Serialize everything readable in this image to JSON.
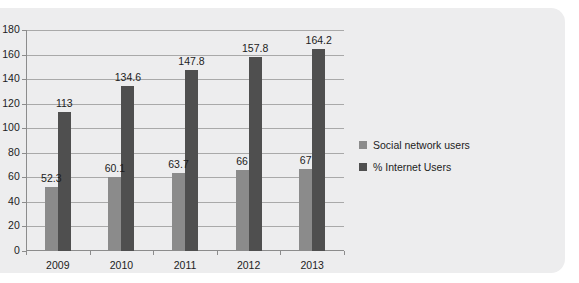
{
  "chart_data": {
    "type": "bar",
    "title": "",
    "xlabel": "",
    "ylabel": "",
    "categories": [
      "2009",
      "2010",
      "2011",
      "2012",
      "2013"
    ],
    "series": [
      {
        "name": "Social network users",
        "color": "#8b8b8b",
        "values": [
          52.3,
          60.1,
          63.7,
          66,
          67
        ],
        "labels": [
          "52.3",
          "60.1",
          "63.7",
          "66",
          "67"
        ]
      },
      {
        "name": "% Internet Users",
        "color": "#4f4f4f",
        "values": [
          113,
          134.6,
          147.8,
          157.8,
          164.2
        ],
        "labels": [
          "113",
          "134.6",
          "147.8",
          "157.8",
          "164.2"
        ]
      }
    ],
    "ylim": [
      0,
      180
    ],
    "yticks": [
      0,
      20,
      40,
      60,
      80,
      100,
      120,
      140,
      160,
      180
    ],
    "ytick_labels": [
      "0",
      "20",
      "40",
      "60",
      "80",
      "100",
      "120",
      "140",
      "160",
      "180"
    ],
    "grid": true,
    "legend_position": "right",
    "background_color": "#ededee",
    "plot_background_color": "#ededee",
    "axis_color": "#8c8c8c",
    "gridline_color": "#a9a9a9",
    "text_color": "#1c1c1c"
  }
}
